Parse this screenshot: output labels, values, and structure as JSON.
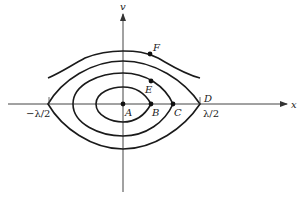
{
  "diagram": {
    "type": "phase-space",
    "axes": {
      "horizontal_label": "x",
      "vertical_label": "v"
    },
    "tick_labels": {
      "left": "−λ/2",
      "right": "λ/2"
    },
    "points": [
      {
        "id": "A",
        "label": "A",
        "description": "origin / center fixed point"
      },
      {
        "id": "B",
        "label": "B",
        "description": "on inner closed orbit at v=0"
      },
      {
        "id": "C",
        "label": "C",
        "description": "on middle closed orbit at v=0"
      },
      {
        "id": "D",
        "label": "D",
        "description": "separatrix crossing at x=λ/2"
      },
      {
        "id": "E",
        "label": "E",
        "description": "point on middle closed orbit"
      },
      {
        "id": "F",
        "label": "F",
        "description": "point on open (untrapped) trajectory"
      }
    ],
    "curves": [
      {
        "name": "inner-orbit",
        "kind": "closed"
      },
      {
        "name": "middle-orbit",
        "kind": "closed"
      },
      {
        "name": "separatrix",
        "kind": "separatrix"
      },
      {
        "name": "open-trajectory",
        "kind": "open"
      }
    ],
    "colors": {
      "stroke": "#1a1a1a",
      "background": "#ffffff"
    }
  }
}
